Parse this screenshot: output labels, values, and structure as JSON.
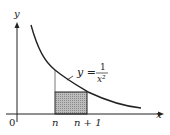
{
  "diagram": {
    "axes": {
      "x_label": "x",
      "y_label": "y",
      "origin_label": "0"
    },
    "curve": {
      "equation_lhs": "y =",
      "equation_numerator": "1",
      "equation_denominator": "x²"
    },
    "ticks": {
      "n": "n",
      "n_plus_1": "n + 1"
    },
    "colors": {
      "stroke": "#222222",
      "shade": "#b5b5b5",
      "background": "#ffffff"
    }
  }
}
